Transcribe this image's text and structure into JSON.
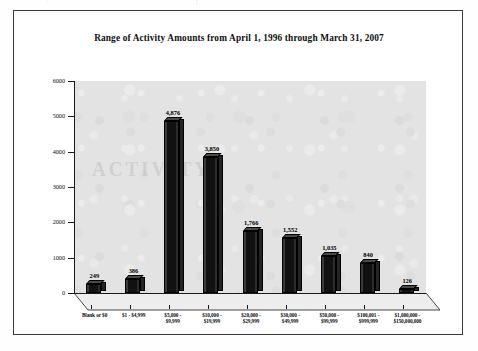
{
  "page": {
    "bleed_left": "·",
    "bleed_right": "¦"
  },
  "chart_data": {
    "type": "bar",
    "title": "Range of Activity Amounts from April 1, 1996 through March 31, 2007",
    "xlabel": "",
    "ylabel": "",
    "ylim": [
      0,
      6000
    ],
    "yticks": [
      0,
      1000,
      2000,
      3000,
      4000,
      5000,
      6000
    ],
    "ytick_labels": [
      "0",
      "1000",
      "2000",
      "3000",
      "4000",
      "5000",
      "6000"
    ],
    "grid": false,
    "legend": "none",
    "style": "3d-bar",
    "bar_color": "#111111",
    "panel_color": "#e3e3e3",
    "categories": [
      "Blank or $0",
      "$1 - $4,999",
      "$5,000 -\n$9,999",
      "$10,000 -\n$19,999",
      "$20,000 -\n$29,999",
      "$30,000 -\n$49,999",
      "$50,000 -\n$99,999",
      "$100,001 -\n$999,999",
      "$1,000,000 -\n$150,000,000"
    ],
    "values": [
      249,
      386,
      4876,
      3850,
      1766,
      1552,
      1035,
      840,
      126
    ],
    "value_labels": [
      "249",
      "386",
      "4,876",
      "3,850",
      "1,766",
      "1,552",
      "1,035",
      "840",
      "126"
    ]
  }
}
